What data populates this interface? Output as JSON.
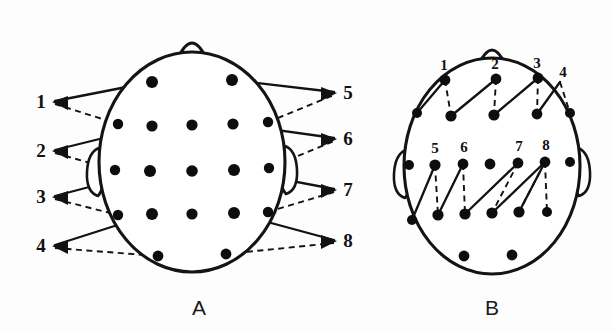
{
  "figure": {
    "background_color": "#fdfdfd",
    "ink_color": "#121212",
    "electrode_color": "#0d0d0d"
  },
  "panels": [
    {
      "id": "A",
      "caption": "A",
      "caption_x": 199,
      "caption_y": 315,
      "description": "Head seen from above with electrode array; numbered derivations 1-8 indicated by solid and dashed leads drawn outside the head outline",
      "head": {
        "cx": 192,
        "cy": 162,
        "rx": 93,
        "ry": 110,
        "nose_x": 192,
        "nose_y": 52,
        "ears": [
          "left",
          "right"
        ]
      },
      "electrodes": [
        {
          "x": 152,
          "y": 82
        },
        {
          "x": 232,
          "y": 80
        },
        {
          "x": 118,
          "y": 124
        },
        {
          "x": 152,
          "y": 126
        },
        {
          "x": 192,
          "y": 125
        },
        {
          "x": 233,
          "y": 124
        },
        {
          "x": 268,
          "y": 122
        },
        {
          "x": 115,
          "y": 170
        },
        {
          "x": 150,
          "y": 171
        },
        {
          "x": 192,
          "y": 171
        },
        {
          "x": 234,
          "y": 170
        },
        {
          "x": 269,
          "y": 168
        },
        {
          "x": 118,
          "y": 215
        },
        {
          "x": 152,
          "y": 214
        },
        {
          "x": 192,
          "y": 214
        },
        {
          "x": 234,
          "y": 213
        },
        {
          "x": 268,
          "y": 212
        },
        {
          "x": 158,
          "y": 256
        },
        {
          "x": 226,
          "y": 254
        }
      ],
      "leads_left": [
        {
          "label": "1",
          "label_x": 41,
          "label_y": 104,
          "solid_to_x": 152,
          "solid_to_y": 82,
          "dashed_to_x": 118,
          "dashed_to_y": 124
        },
        {
          "label": "2",
          "label_x": 41,
          "label_y": 153,
          "solid_to_x": 152,
          "solid_to_y": 126,
          "dashed_to_x": 115,
          "dashed_to_y": 170
        },
        {
          "label": "3",
          "label_x": 41,
          "label_y": 199,
          "solid_to_x": 150,
          "solid_to_y": 171,
          "dashed_to_x": 118,
          "dashed_to_y": 215
        },
        {
          "label": "4",
          "label_x": 41,
          "label_y": 248,
          "solid_to_x": 152,
          "solid_to_y": 214,
          "dashed_to_x": 158,
          "dashed_to_y": 256
        }
      ],
      "leads_right": [
        {
          "label": "5",
          "label_x": 348,
          "label_y": 95,
          "solid_from_x": 232,
          "solid_from_y": 80,
          "dashed_from_x": 268,
          "dashed_from_y": 122
        },
        {
          "label": "6",
          "label_x": 348,
          "label_y": 141,
          "solid_from_x": 233,
          "solid_from_y": 124,
          "dashed_from_x": 269,
          "dashed_from_y": 168
        },
        {
          "label": "7",
          "label_x": 348,
          "label_y": 192,
          "solid_from_x": 234,
          "solid_from_y": 170,
          "dashed_from_x": 268,
          "dashed_from_y": 212
        },
        {
          "label": "8",
          "label_x": 348,
          "label_y": 243,
          "solid_from_x": 234,
          "solid_from_y": 213,
          "dashed_from_x": 226,
          "dashed_from_y": 254
        }
      ]
    },
    {
      "id": "B",
      "caption": "B",
      "caption_x": 492,
      "caption_y": 315,
      "description": "Same head with the eight derivations drawn as zigzag chains directly on the scalp; solid segments ascend, dashed segments descend",
      "head": {
        "cx": 492,
        "cy": 166,
        "rx": 88,
        "ry": 108,
        "nose_x": 492,
        "nose_y": 58,
        "ears": [
          "left",
          "right"
        ]
      },
      "electrodes": [
        {
          "x": 445,
          "y": 80
        },
        {
          "x": 496,
          "y": 79
        },
        {
          "x": 538,
          "y": 78
        },
        {
          "x": 417,
          "y": 113
        },
        {
          "x": 451,
          "y": 116
        },
        {
          "x": 494,
          "y": 115
        },
        {
          "x": 537,
          "y": 114
        },
        {
          "x": 570,
          "y": 113
        },
        {
          "x": 409,
          "y": 165
        },
        {
          "x": 435,
          "y": 165
        },
        {
          "x": 463,
          "y": 164
        },
        {
          "x": 490,
          "y": 164
        },
        {
          "x": 518,
          "y": 163
        },
        {
          "x": 545,
          "y": 162
        },
        {
          "x": 570,
          "y": 162
        },
        {
          "x": 412,
          "y": 220
        },
        {
          "x": 438,
          "y": 215
        },
        {
          "x": 465,
          "y": 214
        },
        {
          "x": 492,
          "y": 213
        },
        {
          "x": 519,
          "y": 212
        },
        {
          "x": 547,
          "y": 212
        },
        {
          "x": 464,
          "y": 256
        },
        {
          "x": 512,
          "y": 255
        }
      ],
      "chain_upper": {
        "numbers": [
          {
            "label": "1",
            "x": 444,
            "y": 70
          },
          {
            "label": "2",
            "x": 495,
            "y": 69
          },
          {
            "label": "3",
            "x": 537,
            "y": 68
          },
          {
            "label": "4",
            "x": 562,
            "y": 76
          }
        ],
        "vertices": [
          {
            "x": 417,
            "y": 113
          },
          {
            "x": 445,
            "y": 80
          },
          {
            "x": 451,
            "y": 116
          },
          {
            "x": 496,
            "y": 79
          },
          {
            "x": 494,
            "y": 115
          },
          {
            "x": 538,
            "y": 78
          },
          {
            "x": 537,
            "y": 114
          },
          {
            "x": 560,
            "y": 82
          },
          {
            "x": 570,
            "y": 113
          }
        ]
      },
      "chain_lower": {
        "numbers": [
          {
            "label": "5",
            "x": 435,
            "y": 153
          },
          {
            "label": "6",
            "x": 464,
            "y": 152
          },
          {
            "label": "7",
            "x": 519,
            "y": 151
          },
          {
            "label": "8",
            "x": 546,
            "y": 150
          }
        ],
        "vertices": [
          {
            "x": 412,
            "y": 220
          },
          {
            "x": 435,
            "y": 165
          },
          {
            "x": 438,
            "y": 215
          },
          {
            "x": 463,
            "y": 164
          },
          {
            "x": 465,
            "y": 214
          },
          {
            "x": 518,
            "y": 163
          },
          {
            "x": 492,
            "y": 213
          },
          {
            "x": 545,
            "y": 162
          },
          {
            "x": 519,
            "y": 212
          },
          {
            "x": 547,
            "y": 212
          }
        ]
      }
    }
  ]
}
